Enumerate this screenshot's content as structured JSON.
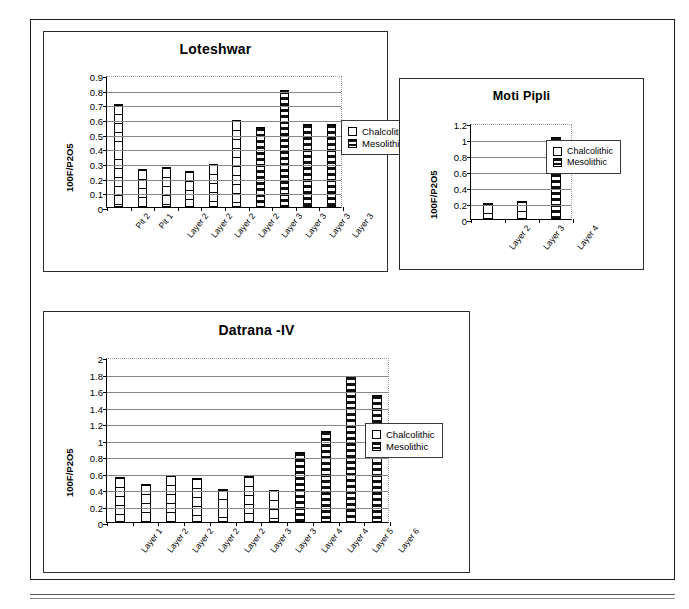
{
  "page": {
    "background_color": "#ffffff",
    "frame_color": "#1d1d1d"
  },
  "legend": {
    "chalcolithic_label": "Chalcolithic",
    "mesolithic_label": "Mesolithic",
    "chalcolithic_swatch": "white-square-icon",
    "mesolithic_swatch": "striped-square-icon"
  },
  "chart_data": [
    {
      "id": "loteshwar",
      "type": "bar",
      "title": "Loteshwar",
      "xlabel": "",
      "ylabel": "100F/P2O5",
      "ylim": [
        0,
        0.9
      ],
      "yticks": [
        "0.9",
        "0.8",
        "0.7",
        "0.6",
        "0.5",
        "0.4",
        "0.3",
        "0.2",
        "0.1",
        "0"
      ],
      "ytick_values": [
        0.9,
        0.8,
        0.7,
        0.6,
        0.5,
        0.4,
        0.3,
        0.2,
        0.1,
        0
      ],
      "grid": true,
      "legend_position": "right",
      "categories": [
        "Pit 2",
        "Pit 1",
        "Layer 2",
        "Layer 2",
        "Layer 2",
        "Layer 2",
        "Layer 3",
        "Layer 3",
        "Layer 3",
        "Layer 3"
      ],
      "values": [
        0.7,
        0.26,
        0.27,
        0.245,
        0.29,
        0.59,
        0.545,
        0.8,
        0.565,
        0.565
      ],
      "groups": [
        "Chalcolithic",
        "Chalcolithic",
        "Chalcolithic",
        "Chalcolithic",
        "Chalcolithic",
        "Chalcolithic",
        "Mesolithic",
        "Mesolithic",
        "Mesolithic",
        "Mesolithic"
      ],
      "series": [
        {
          "name": "Chalcolithic",
          "values": [
            0.7,
            0.26,
            0.27,
            0.245,
            0.29,
            0.59,
            null,
            null,
            null,
            null
          ]
        },
        {
          "name": "Mesolithic",
          "values": [
            null,
            null,
            null,
            null,
            null,
            null,
            0.545,
            0.8,
            0.565,
            0.565
          ]
        }
      ]
    },
    {
      "id": "moti-pipli",
      "type": "bar",
      "title": "Moti Pipli",
      "xlabel": "",
      "ylabel": "100F/P2O5",
      "ylim": [
        0,
        1.2
      ],
      "yticks": [
        "1.2",
        "1",
        "0.8",
        "0.6",
        "0.4",
        "0.2",
        "0"
      ],
      "ytick_values": [
        1.2,
        1,
        0.8,
        0.6,
        0.4,
        0.2,
        0
      ],
      "grid": true,
      "legend_position": "right",
      "categories": [
        "Layer 2",
        "Layer 3",
        "Layer 4"
      ],
      "values": [
        0.2,
        0.22,
        1.03
      ],
      "groups": [
        "Chalcolithic",
        "Chalcolithic",
        "Mesolithic"
      ],
      "series": [
        {
          "name": "Chalcolithic",
          "values": [
            0.2,
            0.22,
            null
          ]
        },
        {
          "name": "Mesolithic",
          "values": [
            null,
            null,
            1.03
          ]
        }
      ]
    },
    {
      "id": "datrana-iv",
      "type": "bar",
      "title": "Datrana -IV",
      "xlabel": "",
      "ylabel": "100F/P2O5",
      "ylim": [
        0,
        2
      ],
      "yticks": [
        "2",
        "1.8",
        "1.6",
        "1.4",
        "1.2",
        "1",
        "0.8",
        "0.6",
        "0.4",
        "0.2",
        "0"
      ],
      "ytick_values": [
        2,
        1.8,
        1.6,
        1.4,
        1.2,
        1,
        0.8,
        0.6,
        0.4,
        0.2,
        0
      ],
      "grid": true,
      "legend_position": "right",
      "categories": [
        "Layer 1",
        "Layer 2",
        "Layer 2",
        "Layer 2",
        "Layer 2",
        "Layer 3",
        "Layer 3",
        "Layer 4",
        "Layer 4",
        "Layer 5",
        "Layer 6"
      ],
      "values": [
        0.55,
        0.465,
        0.575,
        0.535,
        0.4,
        0.555,
        0.385,
        0.85,
        1.1,
        1.765,
        1.535
      ],
      "groups": [
        "Chalcolithic",
        "Chalcolithic",
        "Chalcolithic",
        "Chalcolithic",
        "Chalcolithic",
        "Chalcolithic",
        "Chalcolithic",
        "Mesolithic",
        "Mesolithic",
        "Mesolithic",
        "Mesolithic"
      ],
      "series": [
        {
          "name": "Chalcolithic",
          "values": [
            0.55,
            0.465,
            0.575,
            0.535,
            0.4,
            0.555,
            0.385,
            null,
            null,
            null,
            null
          ]
        },
        {
          "name": "Mesolithic",
          "values": [
            null,
            null,
            null,
            null,
            null,
            null,
            null,
            0.85,
            1.1,
            1.765,
            1.535
          ]
        }
      ]
    }
  ]
}
